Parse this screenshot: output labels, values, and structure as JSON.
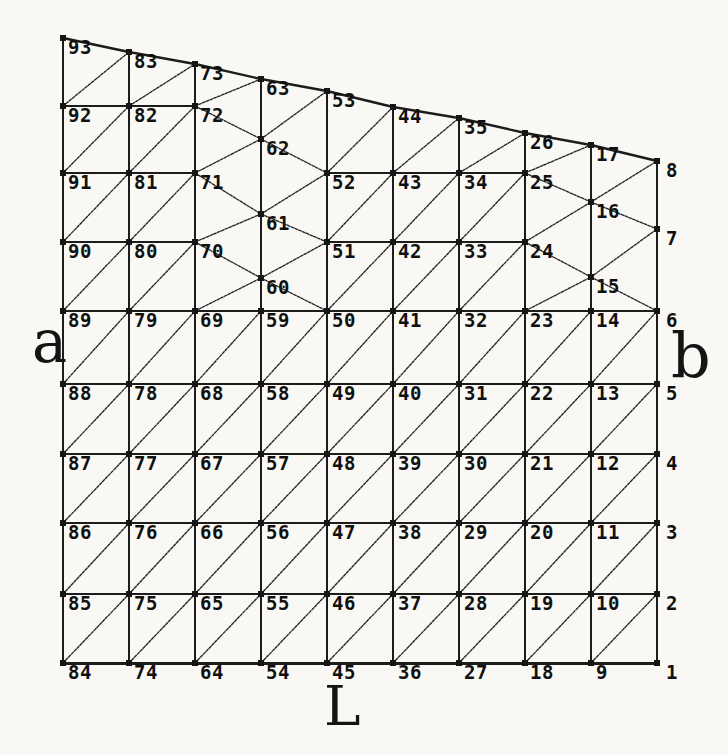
{
  "figure": {
    "canvas": {
      "width": 728,
      "height": 755
    },
    "colors": {
      "ink": "#1c1c1c",
      "paper": "#f9f8f4"
    },
    "labels": {
      "left": {
        "text": "a"
      },
      "right": {
        "text": "b"
      },
      "bottom": {
        "text": "L"
      }
    },
    "label_rules": {
      "font_size": 19,
      "default_offset": [
        5,
        2
      ],
      "right_edge_offset": [
        9,
        2
      ],
      "right_edge_x": 657
    },
    "node_dot_size": 6,
    "nodes": [
      [
        1,
        657,
        663
      ],
      [
        2,
        657,
        594
      ],
      [
        3,
        657,
        523
      ],
      [
        4,
        657,
        454
      ],
      [
        5,
        657,
        384
      ],
      [
        6,
        657,
        311
      ],
      [
        7,
        657,
        229
      ],
      [
        8,
        657,
        161
      ],
      [
        9,
        591,
        663
      ],
      [
        10,
        591,
        594
      ],
      [
        11,
        591,
        523
      ],
      [
        12,
        591,
        454
      ],
      [
        13,
        591,
        384
      ],
      [
        14,
        591,
        311
      ],
      [
        15,
        591,
        277
      ],
      [
        16,
        591,
        202
      ],
      [
        17,
        591,
        145
      ],
      [
        18,
        525,
        663
      ],
      [
        19,
        525,
        594
      ],
      [
        20,
        525,
        523
      ],
      [
        21,
        525,
        454
      ],
      [
        22,
        525,
        384
      ],
      [
        23,
        525,
        311
      ],
      [
        24,
        525,
        242
      ],
      [
        25,
        525,
        173
      ],
      [
        26,
        525,
        133
      ],
      [
        27,
        459,
        663
      ],
      [
        28,
        459,
        594
      ],
      [
        29,
        459,
        523
      ],
      [
        30,
        459,
        454
      ],
      [
        31,
        459,
        384
      ],
      [
        32,
        459,
        311
      ],
      [
        33,
        459,
        242
      ],
      [
        34,
        459,
        173
      ],
      [
        35,
        459,
        118
      ],
      [
        36,
        393,
        663
      ],
      [
        37,
        393,
        594
      ],
      [
        38,
        393,
        523
      ],
      [
        39,
        393,
        454
      ],
      [
        40,
        393,
        384
      ],
      [
        41,
        393,
        311
      ],
      [
        42,
        393,
        242
      ],
      [
        43,
        393,
        173
      ],
      [
        44,
        393,
        107
      ],
      [
        45,
        327,
        663
      ],
      [
        46,
        327,
        594
      ],
      [
        47,
        327,
        523
      ],
      [
        48,
        327,
        454
      ],
      [
        49,
        327,
        384
      ],
      [
        50,
        327,
        311
      ],
      [
        51,
        327,
        242
      ],
      [
        52,
        327,
        173
      ],
      [
        53,
        327,
        91
      ],
      [
        54,
        261,
        663
      ],
      [
        55,
        261,
        594
      ],
      [
        56,
        261,
        523
      ],
      [
        57,
        261,
        454
      ],
      [
        58,
        261,
        384
      ],
      [
        59,
        261,
        311
      ],
      [
        60,
        261,
        278
      ],
      [
        61,
        261,
        214
      ],
      [
        62,
        261,
        139
      ],
      [
        63,
        261,
        79
      ],
      [
        64,
        195,
        663
      ],
      [
        65,
        195,
        594
      ],
      [
        66,
        195,
        523
      ],
      [
        67,
        195,
        454
      ],
      [
        68,
        195,
        384
      ],
      [
        69,
        195,
        311
      ],
      [
        70,
        195,
        242
      ],
      [
        71,
        195,
        173
      ],
      [
        72,
        195,
        106
      ],
      [
        73,
        195,
        64
      ],
      [
        74,
        129,
        663
      ],
      [
        75,
        129,
        594
      ],
      [
        76,
        129,
        523
      ],
      [
        77,
        129,
        454
      ],
      [
        78,
        129,
        384
      ],
      [
        79,
        129,
        311
      ],
      [
        80,
        129,
        242
      ],
      [
        81,
        129,
        173
      ],
      [
        82,
        129,
        106
      ],
      [
        83,
        129,
        52
      ],
      [
        84,
        63,
        663
      ],
      [
        85,
        63,
        594
      ],
      [
        86,
        63,
        523
      ],
      [
        87,
        63,
        454
      ],
      [
        88,
        63,
        384
      ],
      [
        89,
        63,
        311
      ],
      [
        90,
        63,
        242
      ],
      [
        91,
        63,
        173
      ],
      [
        92,
        63,
        106
      ],
      [
        93,
        63,
        38
      ]
    ],
    "edges": {
      "vertical": [
        [
          1,
          2
        ],
        [
          2,
          3
        ],
        [
          3,
          4
        ],
        [
          4,
          5
        ],
        [
          5,
          6
        ],
        [
          6,
          7
        ],
        [
          7,
          8
        ],
        [
          9,
          10
        ],
        [
          10,
          11
        ],
        [
          11,
          12
        ],
        [
          12,
          13
        ],
        [
          13,
          14
        ],
        [
          14,
          15
        ],
        [
          15,
          16
        ],
        [
          16,
          17
        ],
        [
          18,
          19
        ],
        [
          19,
          20
        ],
        [
          20,
          21
        ],
        [
          21,
          22
        ],
        [
          22,
          23
        ],
        [
          23,
          24
        ],
        [
          24,
          25
        ],
        [
          25,
          26
        ],
        [
          27,
          28
        ],
        [
          28,
          29
        ],
        [
          29,
          30
        ],
        [
          30,
          31
        ],
        [
          31,
          32
        ],
        [
          32,
          33
        ],
        [
          33,
          34
        ],
        [
          34,
          35
        ],
        [
          36,
          37
        ],
        [
          37,
          38
        ],
        [
          38,
          39
        ],
        [
          39,
          40
        ],
        [
          40,
          41
        ],
        [
          41,
          42
        ],
        [
          42,
          43
        ],
        [
          43,
          44
        ],
        [
          45,
          46
        ],
        [
          46,
          47
        ],
        [
          47,
          48
        ],
        [
          48,
          49
        ],
        [
          49,
          50
        ],
        [
          50,
          51
        ],
        [
          51,
          52
        ],
        [
          52,
          53
        ],
        [
          54,
          55
        ],
        [
          55,
          56
        ],
        [
          56,
          57
        ],
        [
          57,
          58
        ],
        [
          58,
          59
        ],
        [
          59,
          60
        ],
        [
          60,
          61
        ],
        [
          61,
          62
        ],
        [
          62,
          63
        ],
        [
          64,
          65
        ],
        [
          65,
          66
        ],
        [
          66,
          67
        ],
        [
          67,
          68
        ],
        [
          68,
          69
        ],
        [
          69,
          70
        ],
        [
          70,
          71
        ],
        [
          71,
          72
        ],
        [
          72,
          73
        ],
        [
          74,
          75
        ],
        [
          75,
          76
        ],
        [
          76,
          77
        ],
        [
          77,
          78
        ],
        [
          78,
          79
        ],
        [
          79,
          80
        ],
        [
          80,
          81
        ],
        [
          81,
          82
        ],
        [
          82,
          83
        ],
        [
          84,
          85
        ],
        [
          85,
          86
        ],
        [
          86,
          87
        ],
        [
          87,
          88
        ],
        [
          88,
          89
        ],
        [
          89,
          90
        ],
        [
          90,
          91
        ],
        [
          91,
          92
        ],
        [
          92,
          93
        ]
      ],
      "horizontal": [
        [
          85,
          75
        ],
        [
          75,
          65
        ],
        [
          65,
          55
        ],
        [
          55,
          46
        ],
        [
          46,
          37
        ],
        [
          37,
          28
        ],
        [
          28,
          19
        ],
        [
          19,
          10
        ],
        [
          10,
          2
        ],
        [
          86,
          76
        ],
        [
          76,
          66
        ],
        [
          66,
          56
        ],
        [
          56,
          47
        ],
        [
          47,
          38
        ],
        [
          38,
          29
        ],
        [
          29,
          20
        ],
        [
          20,
          11
        ],
        [
          11,
          3
        ],
        [
          87,
          77
        ],
        [
          77,
          67
        ],
        [
          67,
          57
        ],
        [
          57,
          48
        ],
        [
          48,
          39
        ],
        [
          39,
          30
        ],
        [
          30,
          21
        ],
        [
          21,
          12
        ],
        [
          12,
          4
        ],
        [
          88,
          78
        ],
        [
          78,
          68
        ],
        [
          68,
          58
        ],
        [
          58,
          49
        ],
        [
          49,
          40
        ],
        [
          40,
          31
        ],
        [
          31,
          22
        ],
        [
          22,
          13
        ],
        [
          13,
          5
        ],
        [
          89,
          79
        ],
        [
          79,
          69
        ],
        [
          69,
          59
        ],
        [
          59,
          50
        ],
        [
          50,
          41
        ],
        [
          41,
          32
        ],
        [
          32,
          23
        ],
        [
          23,
          14
        ],
        [
          14,
          6
        ],
        [
          90,
          80
        ],
        [
          80,
          70
        ],
        [
          51,
          42
        ],
        [
          42,
          33
        ],
        [
          33,
          24
        ],
        [
          91,
          81
        ],
        [
          81,
          71
        ],
        [
          52,
          43
        ],
        [
          43,
          34
        ],
        [
          34,
          25
        ],
        [
          92,
          82
        ],
        [
          82,
          72
        ]
      ],
      "bottom": [
        [
          84,
          74
        ],
        [
          74,
          64
        ],
        [
          64,
          54
        ],
        [
          54,
          45
        ],
        [
          45,
          36
        ],
        [
          36,
          27
        ],
        [
          27,
          18
        ],
        [
          18,
          9
        ],
        [
          9,
          1
        ]
      ],
      "top": [
        [
          93,
          83
        ],
        [
          83,
          73
        ],
        [
          73,
          63
        ],
        [
          63,
          53
        ],
        [
          53,
          44
        ],
        [
          44,
          35
        ],
        [
          35,
          26
        ],
        [
          26,
          17
        ],
        [
          17,
          8
        ]
      ],
      "diagonal": [
        [
          84,
          75
        ],
        [
          85,
          76
        ],
        [
          86,
          77
        ],
        [
          87,
          78
        ],
        [
          88,
          79
        ],
        [
          89,
          80
        ],
        [
          90,
          81
        ],
        [
          91,
          82
        ],
        [
          92,
          83
        ],
        [
          74,
          65
        ],
        [
          75,
          66
        ],
        [
          76,
          67
        ],
        [
          77,
          68
        ],
        [
          78,
          69
        ],
        [
          79,
          70
        ],
        [
          80,
          71
        ],
        [
          81,
          72
        ],
        [
          82,
          73
        ],
        [
          64,
          55
        ],
        [
          65,
          56
        ],
        [
          66,
          57
        ],
        [
          67,
          58
        ],
        [
          68,
          59
        ],
        [
          69,
          60
        ],
        [
          70,
          60
        ],
        [
          70,
          61
        ],
        [
          71,
          61
        ],
        [
          71,
          62
        ],
        [
          72,
          62
        ],
        [
          72,
          63
        ],
        [
          54,
          46
        ],
        [
          55,
          47
        ],
        [
          56,
          48
        ],
        [
          57,
          49
        ],
        [
          58,
          50
        ],
        [
          60,
          50
        ],
        [
          60,
          51
        ],
        [
          61,
          51
        ],
        [
          61,
          52
        ],
        [
          62,
          52
        ],
        [
          62,
          53
        ],
        [
          45,
          37
        ],
        [
          46,
          38
        ],
        [
          47,
          39
        ],
        [
          48,
          40
        ],
        [
          49,
          41
        ],
        [
          50,
          42
        ],
        [
          51,
          43
        ],
        [
          52,
          44
        ],
        [
          36,
          28
        ],
        [
          37,
          29
        ],
        [
          38,
          30
        ],
        [
          39,
          31
        ],
        [
          40,
          32
        ],
        [
          41,
          33
        ],
        [
          42,
          34
        ],
        [
          43,
          35
        ],
        [
          27,
          19
        ],
        [
          28,
          20
        ],
        [
          29,
          21
        ],
        [
          30,
          22
        ],
        [
          31,
          23
        ],
        [
          32,
          24
        ],
        [
          33,
          25
        ],
        [
          34,
          26
        ],
        [
          18,
          10
        ],
        [
          19,
          11
        ],
        [
          20,
          12
        ],
        [
          21,
          13
        ],
        [
          22,
          14
        ],
        [
          23,
          15
        ],
        [
          24,
          15
        ],
        [
          24,
          16
        ],
        [
          25,
          16
        ],
        [
          25,
          17
        ],
        [
          9,
          2
        ],
        [
          10,
          3
        ],
        [
          11,
          4
        ],
        [
          12,
          5
        ],
        [
          13,
          6
        ],
        [
          15,
          6
        ],
        [
          15,
          7
        ],
        [
          16,
          7
        ],
        [
          16,
          8
        ]
      ]
    }
  }
}
